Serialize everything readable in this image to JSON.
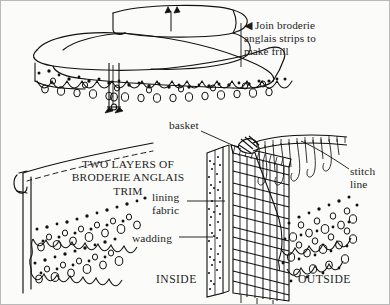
{
  "figure": {
    "background_color": "#fbfbf9",
    "border_color": "#b9b9b9",
    "ink_color": "#111111",
    "text_color": "#1d1d1d",
    "width": 390,
    "height": 305
  },
  "labels": {
    "join_instruction": "◀ Join broderie\nanglais strips to\nmake frill",
    "two_layers": "TWO LAYERS OF\nBRODERIE ANGLAIS\nTRIM",
    "lining_fabric": "lining\nfabric",
    "wadding": "wadding",
    "basket": "basket",
    "stitch_line": "stitch\nline",
    "inside": "INSIDE",
    "outside": "OUTSIDE"
  },
  "diagram_parts": [
    "broderie-anglais-strip-top",
    "broderie-anglais-strip-joined",
    "scalloped-eyelet-edge",
    "seam-notch-marker",
    "two-layer-trim-panel",
    "basket-weave-cross-section",
    "wadding-stipple-layer",
    "lining-fabric-layer",
    "hanging-thread-loops",
    "leader-lines"
  ]
}
